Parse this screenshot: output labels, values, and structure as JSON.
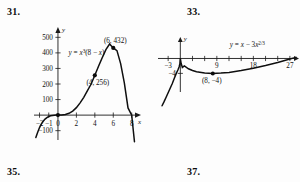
{
  "problems": {
    "p31": "31.",
    "p33": "33.",
    "p35": "35.",
    "p37": "37."
  },
  "chart_data": [
    {
      "id": "figure-31",
      "type": "line",
      "title": "",
      "equation_label": "y = x³(8 − x)",
      "equation_base": "y = x",
      "equation_exp": "3",
      "equation_tail": "(8 − x)",
      "xlabel": "x",
      "ylabel": "y",
      "xlim": [
        -2.6,
        8.9
      ],
      "ylim": [
        -160,
        560
      ],
      "grid": false,
      "legend": "none",
      "xticks": [
        -2,
        -1,
        0,
        2,
        4,
        6,
        8
      ],
      "xticklabels": [
        "−2",
        "−1",
        "0",
        "2",
        "4",
        "6",
        "8"
      ],
      "yticks": [
        -100,
        100,
        200,
        300,
        400,
        500
      ],
      "yticklabels": [
        "−100",
        "100",
        "200",
        "300",
        "400",
        "500"
      ],
      "points": [
        {
          "x": 4,
          "y": 256,
          "label": "(4, 256)"
        },
        {
          "x": 6,
          "y": 432,
          "label": "(6, 432)"
        },
        {
          "x": 0,
          "y": 0,
          "label": ""
        }
      ],
      "x": [
        -2.4,
        -2.2,
        -2,
        -1.8,
        -1.6,
        -1.4,
        -1.2,
        -1,
        -0.8,
        -0.6,
        -0.4,
        -0.2,
        0,
        0.4,
        0.8,
        1.2,
        1.6,
        2,
        2.4,
        2.8,
        3.2,
        3.6,
        4,
        4.4,
        4.8,
        5.2,
        5.6,
        6,
        6.4,
        6.8,
        7.2,
        7.6,
        8,
        8.3,
        8.5
      ],
      "values": [
        -143.4,
        -110.4,
        -80,
        -56.4,
        -39.3,
        -25.8,
        -15.9,
        -9,
        -4.5,
        -1.9,
        -0.5,
        -0.06,
        0,
        0.48,
        3.7,
        11.7,
        26.2,
        48,
        78.7,
        114.4,
        156.8,
        199.9,
        256,
        313.6,
        368.6,
        421.1,
        457.2,
        432,
        414.7,
        331.1,
        207.4,
        46.2,
        0,
        -171.4,
        -271.4
      ]
    },
    {
      "id": "figure-33",
      "type": "line",
      "title": "",
      "equation_label": "y = x − 3x^(2/3)",
      "equation_base": "y = x − 3x",
      "equation_exp": "2/3",
      "xlabel": "",
      "ylabel": "y",
      "xlim": [
        -5.5,
        29
      ],
      "ylim": [
        -9,
        5.5
      ],
      "grid": false,
      "legend": "none",
      "xticks": [
        -3,
        3,
        6,
        9,
        12,
        15,
        18,
        21,
        24,
        27
      ],
      "xticklabels": [
        "−3",
        "",
        "",
        "9",
        "",
        "",
        "18",
        "",
        "",
        "27"
      ],
      "yticks": [
        -4
      ],
      "yticklabels": [
        "−4"
      ],
      "points": [
        {
          "x": 8,
          "y": -4,
          "label": "(8, −4)"
        }
      ],
      "x": [
        -4.5,
        -4,
        -3.5,
        -3,
        -2.5,
        -2,
        -1.5,
        -1,
        -0.6,
        -0.3,
        -0.1,
        0,
        0.2,
        0.5,
        1,
        2,
        3,
        4,
        6,
        8,
        10,
        12,
        15,
        18,
        21,
        24,
        27,
        28.5
      ],
      "values": [
        -12.7,
        -11.6,
        -10.4,
        -9.2,
        -8,
        -6.8,
        -5.4,
        -4,
        -3.1,
        -2.3,
        -1.4,
        0,
        -1.3,
        -2.4,
        -2,
        -2.76,
        -3.24,
        -3.56,
        -3.9,
        -4,
        -3.93,
        -3.75,
        -3.25,
        -2.62,
        -1.88,
        -1.06,
        -0.16,
        0.3
      ]
    }
  ]
}
